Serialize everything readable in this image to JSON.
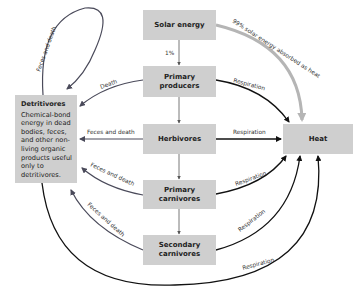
{
  "boxes": {
    "solar": "Solar energy",
    "producers_1": "Primary",
    "producers_2": "producers",
    "herbivores": "Herbivores",
    "primary_carnivores_1": "Primary",
    "primary_carnivores_2": "carnivores",
    "secondary_carnivores_1": "Secondary",
    "secondary_carnivores_2": "carnivores",
    "heat": "Heat"
  },
  "detritivores": {
    "title": "Detritivores",
    "description": "Chemical-bond energy in dead bodies, feces, and other non-living organic products useful only to detritivores."
  },
  "labels": {
    "one_percent": "1%",
    "ninety_nine": "99% solar energy absorbed as heat",
    "feces_death_loop": "Feces and death",
    "death": "Death",
    "feces_death_herb": "Feces and death",
    "feces_death_pc": "Feces and death",
    "feces_death_sc": "Feces and death",
    "resp_producers": "Respiration",
    "resp_herb": "Respiration",
    "resp_pc": "Respiration",
    "resp_sc": "Respiration",
    "resp_det": "Respiration"
  },
  "colors": {
    "box": "#cfcfcf",
    "heat_arrow": "#111111",
    "detritus_arrow": "#4a4a5a",
    "solar_heat_arrow": "#b5b5b5"
  }
}
